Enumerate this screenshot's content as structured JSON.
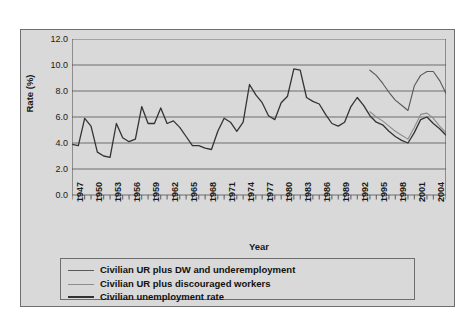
{
  "chart_data": {
    "type": "line",
    "title": "",
    "xlabel": "Year",
    "ylabel": "Rate (%)",
    "ylim": [
      0.0,
      12.0
    ],
    "ytick_labels": [
      "12.0",
      "10.0",
      "8.0",
      "6.0",
      "4.0",
      "2.0",
      "0.0"
    ],
    "ytick_values": [
      12.0,
      10.0,
      8.0,
      6.0,
      4.0,
      2.0,
      0.0
    ],
    "grid": true,
    "legend_position": "bottom",
    "xlim": [
      1947,
      2006
    ],
    "xtick_labels": [
      "1947",
      "1950",
      "1953",
      "1956",
      "1959",
      "1962",
      "1965",
      "1968",
      "1971",
      "1974",
      "1977",
      "1980",
      "1983",
      "1986",
      "1989",
      "1992",
      "1995",
      "1998",
      "2001",
      "2004"
    ],
    "xtick_values": [
      1947,
      1950,
      1953,
      1956,
      1959,
      1962,
      1965,
      1968,
      1971,
      1974,
      1977,
      1980,
      1983,
      1986,
      1989,
      1992,
      1995,
      1998,
      2001,
      2004
    ],
    "x": [
      1947,
      1948,
      1949,
      1950,
      1951,
      1952,
      1953,
      1954,
      1955,
      1956,
      1957,
      1958,
      1959,
      1960,
      1961,
      1962,
      1963,
      1964,
      1965,
      1966,
      1967,
      1968,
      1969,
      1970,
      1971,
      1972,
      1973,
      1974,
      1975,
      1976,
      1977,
      1978,
      1979,
      1980,
      1981,
      1982,
      1983,
      1984,
      1985,
      1986,
      1987,
      1988,
      1989,
      1990,
      1991,
      1992,
      1993,
      1994,
      1995,
      1996,
      1997,
      1998,
      1999,
      2000,
      2001,
      2002,
      2003,
      2004,
      2005,
      2006
    ],
    "series": [
      {
        "name": "Civilian UR plus DW and underemployment",
        "color": "#595959",
        "width": 1.1,
        "x": [
          1994,
          1995,
          1996,
          1997,
          1998,
          1999,
          2000,
          2001,
          2002,
          2003,
          2004,
          2005,
          2006
        ],
        "values": [
          9.6,
          9.2,
          8.6,
          7.9,
          7.3,
          6.9,
          6.5,
          8.4,
          9.2,
          9.5,
          9.5,
          8.8,
          7.8
        ]
      },
      {
        "name": "Civilian UR plus discouraged workers",
        "color": "#8c8c8c",
        "width": 1.1,
        "x": [
          1994,
          1995,
          1996,
          1997,
          1998,
          1999,
          2000,
          2001,
          2002,
          2003,
          2004,
          2005,
          2006
        ],
        "values": [
          6.4,
          6.0,
          5.7,
          5.3,
          4.9,
          4.6,
          4.3,
          5.2,
          6.2,
          6.3,
          5.9,
          5.3,
          4.8
        ]
      },
      {
        "name": "Civilian unemployment rate",
        "color": "#333333",
        "width": 1.3,
        "x": [
          1947,
          1948,
          1949,
          1950,
          1951,
          1952,
          1953,
          1954,
          1955,
          1956,
          1957,
          1958,
          1959,
          1960,
          1961,
          1962,
          1963,
          1964,
          1965,
          1966,
          1967,
          1968,
          1969,
          1970,
          1971,
          1972,
          1973,
          1974,
          1975,
          1976,
          1977,
          1978,
          1979,
          1980,
          1981,
          1982,
          1983,
          1984,
          1985,
          1986,
          1987,
          1988,
          1989,
          1990,
          1991,
          1992,
          1993,
          1994,
          1995,
          1996,
          1997,
          1998,
          1999,
          2000,
          2001,
          2002,
          2003,
          2004,
          2005,
          2006
        ],
        "values": [
          3.9,
          3.8,
          5.9,
          5.3,
          3.3,
          3.0,
          2.9,
          5.5,
          4.4,
          4.1,
          4.3,
          6.8,
          5.5,
          5.5,
          6.7,
          5.5,
          5.7,
          5.2,
          4.5,
          3.8,
          3.8,
          3.6,
          3.5,
          4.9,
          5.9,
          5.6,
          4.9,
          5.6,
          8.5,
          7.7,
          7.1,
          6.1,
          5.8,
          7.1,
          7.6,
          9.7,
          9.6,
          7.5,
          7.2,
          7.0,
          6.2,
          5.5,
          5.3,
          5.6,
          6.8,
          7.5,
          6.9,
          6.1,
          5.6,
          5.4,
          4.9,
          4.5,
          4.2,
          4.0,
          4.8,
          5.8,
          6.0,
          5.5,
          5.1,
          4.6
        ]
      }
    ]
  },
  "legend": {
    "items": [
      {
        "label": "Civilian UR plus DW and underemployment",
        "color": "#595959"
      },
      {
        "label": "Civilian UR plus discouraged workers",
        "color": "#8c8c8c"
      },
      {
        "label": "Civilian unemployment rate",
        "color": "#333333"
      }
    ]
  },
  "colors": {
    "chart_background": "#d9d9d9",
    "page_background": "#ffffff",
    "frame_border": "#6e6e6e",
    "gridline": "#6e6e6e",
    "axis": "#4d4d4d",
    "text": "#1a1a1a"
  }
}
